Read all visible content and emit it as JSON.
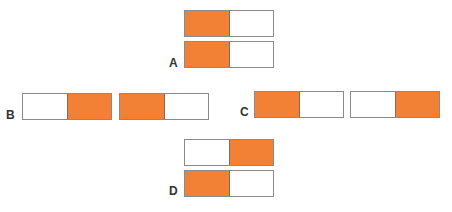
{
  "colors": {
    "filled": "#f28135",
    "empty": "#ffffff",
    "border": "#8a8a8a"
  },
  "groups": [
    {
      "label": "A",
      "bars": [
        [
          "filled",
          "empty"
        ],
        [
          "filled",
          "empty"
        ]
      ]
    },
    {
      "label": "B",
      "bars": [
        [
          "empty",
          "filled"
        ],
        [
          "filled",
          "empty"
        ]
      ]
    },
    {
      "label": "C",
      "bars": [
        [
          "filled",
          "empty"
        ],
        [
          "empty",
          "filled"
        ]
      ]
    },
    {
      "label": "D",
      "bars": [
        [
          "empty",
          "filled"
        ],
        [
          "filled",
          "empty"
        ]
      ]
    }
  ]
}
